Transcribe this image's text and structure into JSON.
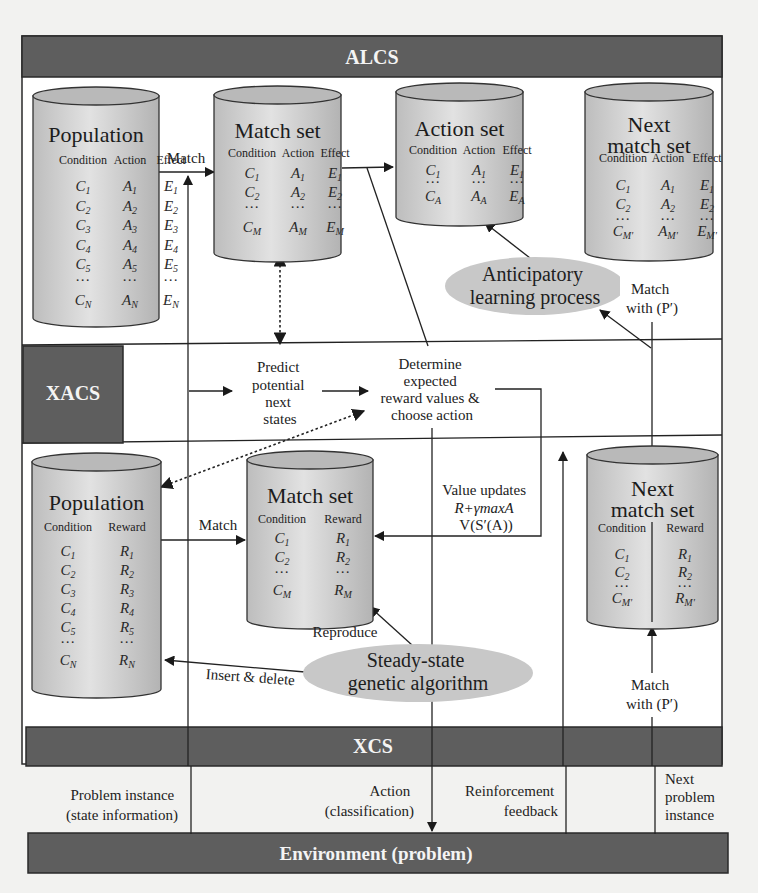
{
  "bands": {
    "alcs": "ALCS",
    "xacs": "XACS",
    "xcs": "XCS",
    "environment": "Environment (problem)"
  },
  "colors": {
    "band": "#5e5e5e",
    "panel": "#ffffff",
    "background": "#f2f2f0",
    "cylinder": "#d2d2d2",
    "ellipse": "#c8c8c8"
  },
  "alcs": {
    "population": {
      "title": "Population",
      "headers": [
        "Condition",
        "Action",
        "Effect"
      ],
      "rows": [
        [
          "C1",
          "A1",
          "E1"
        ],
        [
          "C2",
          "A2",
          "E2"
        ],
        [
          "C3",
          "A3",
          "E3"
        ],
        [
          "C4",
          "A4",
          "E4"
        ],
        [
          "C5",
          "A5",
          "E5"
        ],
        [
          "...",
          "...",
          "..."
        ],
        [
          "CN",
          "AN",
          "EN"
        ]
      ]
    },
    "match_label": "Match",
    "match_set": {
      "title": "Match set",
      "headers": [
        "Condition",
        "Action",
        "Effect"
      ],
      "rows": [
        [
          "C1",
          "A1",
          "E1"
        ],
        [
          "C2",
          "A2",
          "E2"
        ],
        [
          "...",
          "...",
          "..."
        ],
        [
          "CM",
          "AM",
          "EM"
        ]
      ]
    },
    "action_set": {
      "title": "Action set",
      "headers": [
        "Condition",
        "Action",
        "Effect"
      ],
      "rows": [
        [
          "C1",
          "A1",
          "E1"
        ],
        [
          "...",
          "...",
          "..."
        ],
        [
          "CA",
          "AA",
          "EA"
        ]
      ]
    },
    "next_match_set": {
      "title_line1": "Next",
      "title_line2": "match set",
      "headers": [
        "Condition",
        "Action",
        "Effect"
      ],
      "rows": [
        [
          "C1",
          "A1",
          "E1"
        ],
        [
          "C2",
          "A2",
          "E2"
        ],
        [
          "...",
          "...",
          "..."
        ],
        [
          "CM'",
          "AM'",
          "EM'"
        ]
      ]
    },
    "anticipatory": {
      "line1": "Anticipatory",
      "line2": "learning process"
    },
    "match_with": {
      "line1": "Match",
      "line2": "with (P′)"
    }
  },
  "xacs": {
    "predict": [
      "Predict",
      "potential",
      "next",
      "states"
    ],
    "determine": [
      "Determine",
      "expected",
      "reward values &",
      "choose action"
    ]
  },
  "xcs": {
    "population": {
      "title": "Population",
      "headers": [
        "Condition",
        "Reward"
      ],
      "rows": [
        [
          "C1",
          "R1"
        ],
        [
          "C2",
          "R2"
        ],
        [
          "C3",
          "R3"
        ],
        [
          "C4",
          "R4"
        ],
        [
          "C5",
          "R5"
        ],
        [
          "...",
          "..."
        ],
        [
          "CN",
          "RN"
        ]
      ]
    },
    "match_label": "Match",
    "match_set": {
      "title": "Match set",
      "headers": [
        "Condition",
        "Reward"
      ],
      "rows": [
        [
          "C1",
          "R1"
        ],
        [
          "C2",
          "R2"
        ],
        [
          "...",
          "..."
        ],
        [
          "CM",
          "RM"
        ]
      ]
    },
    "value_updates": [
      "Value updates",
      "R+γmaxA",
      "V(S′(A))"
    ],
    "next_match_set": {
      "title_line1": "Next",
      "title_line2": "match set",
      "headers": [
        "Condition",
        "Reward"
      ],
      "rows": [
        [
          "C1",
          "R1"
        ],
        [
          "C2",
          "R2"
        ],
        [
          "...",
          "..."
        ],
        [
          "CM'",
          "RM'"
        ]
      ]
    },
    "reproduce": "Reproduce",
    "insert_delete": "Insert & delete",
    "ga": {
      "line1": "Steady-state",
      "line2": "genetic algorithm"
    },
    "match_with": {
      "line1": "Match",
      "line2": "with (P′)"
    }
  },
  "environment_labels": {
    "problem_instance": [
      "Problem instance",
      "(state information)"
    ],
    "action": [
      "Action",
      "(classification)"
    ],
    "reinforcement": [
      "Reinforcement",
      "feedback"
    ],
    "next_problem": [
      "Next",
      "problem",
      "instance"
    ]
  }
}
